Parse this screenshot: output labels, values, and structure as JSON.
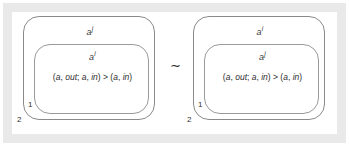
{
  "figure": {
    "connector": "∼",
    "colors": {
      "frame": "#e9e9e9",
      "background": "#ffffff",
      "outer_stroke": "#8a8a8a",
      "inner_stroke": "#9a9a9a",
      "text": "#2e2e2e"
    },
    "panels": [
      {
        "name": "left",
        "outer_label": {
          "base": "a",
          "sup": "j"
        },
        "inner_label": {
          "base": "a",
          "sup": "i"
        },
        "formula": "(a, out; a, in) > (a, in)",
        "formula_parts": {
          "open": "(",
          "a1": "a",
          "sep1": ", ",
          "out": "out",
          "semi": "; ",
          "a2": "a",
          "sep2": ", ",
          "in1": "in",
          "close1": ")",
          "relation": " > ",
          "open2": "(",
          "a3": "a",
          "sep3": ", ",
          "in2": "in",
          "close2": ")"
        },
        "region_numbers": {
          "inner": "1",
          "outer": "2"
        }
      },
      {
        "name": "right",
        "outer_label": {
          "base": "a",
          "sup": "i"
        },
        "inner_label": {
          "base": "a",
          "sup": "j"
        },
        "formula": "(a, out; a, in) > (a, in)",
        "formula_parts": {
          "open": "(",
          "a1": "a",
          "sep1": ", ",
          "out": "out",
          "semi": "; ",
          "a2": "a",
          "sep2": ", ",
          "in1": "in",
          "close1": ")",
          "relation": " > ",
          "open2": "(",
          "a3": "a",
          "sep3": ", ",
          "in2": "in",
          "close2": ")"
        },
        "region_numbers": {
          "inner": "1",
          "outer": "2"
        }
      }
    ]
  }
}
